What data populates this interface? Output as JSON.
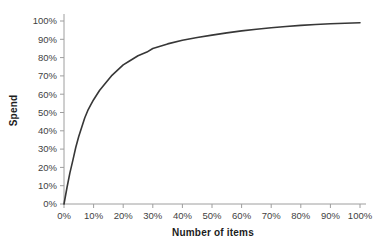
{
  "chart_data": {
    "type": "line",
    "title": "",
    "xlabel": "Number of items",
    "ylabel": "Spend",
    "xlim": [
      0,
      100
    ],
    "ylim": [
      0,
      100
    ],
    "grid": false,
    "legend": "none",
    "x_tick_labels": [
      "0%",
      "10%",
      "20%",
      "30%",
      "40%",
      "50%",
      "60%",
      "70%",
      "80%",
      "90%",
      "100%"
    ],
    "y_tick_labels": [
      "0%",
      "10%",
      "20%",
      "30%",
      "40%",
      "50%",
      "60%",
      "70%",
      "80%",
      "90%",
      "100%"
    ],
    "x_tick_values": [
      0,
      10,
      20,
      30,
      40,
      50,
      60,
      70,
      80,
      90,
      100
    ],
    "y_tick_values": [
      0,
      10,
      20,
      30,
      40,
      50,
      60,
      70,
      80,
      90,
      100
    ],
    "series": [
      {
        "name": "cumulative-spend-curve",
        "x": [
          0,
          1,
          2,
          3,
          4,
          5,
          6,
          7,
          8,
          9,
          10,
          12,
          14,
          16,
          18,
          20,
          22,
          25,
          28,
          30,
          35,
          40,
          45,
          50,
          55,
          60,
          65,
          70,
          75,
          80,
          85,
          90,
          95,
          100
        ],
        "y": [
          0,
          9,
          17,
          24,
          31,
          37,
          42,
          47,
          51,
          54,
          57,
          62,
          66,
          70,
          73,
          76,
          78,
          81,
          83,
          85,
          87.5,
          89.5,
          91,
          92.3,
          93.5,
          94.6,
          95.5,
          96.3,
          97,
          97.6,
          98.1,
          98.5,
          98.8,
          99
        ]
      }
    ],
    "colors": {
      "background": "#ffffff",
      "line": "#373737",
      "axis": "#9e9e9e",
      "tick_label": "#3f3f3f",
      "axis_title": "#1c1c1c"
    }
  }
}
